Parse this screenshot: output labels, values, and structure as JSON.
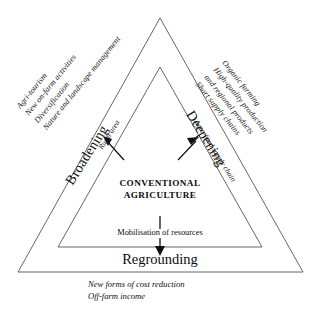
{
  "diagram": {
    "title_core": "CONVENTIONAL\nAGRICULTURE",
    "core_line1": "CONVENTIONAL",
    "core_line2": "AGRICULTURE",
    "stroke_color": "#555555",
    "text_color": "#0d0d0d",
    "background": "#ffffff"
  },
  "axes": {
    "broadening": {
      "label": "Broadening",
      "arrow_label": "Rural area",
      "items": [
        "Agri-tourism",
        "New on-farm activities",
        "Diversification",
        "Nature and landscape management"
      ]
    },
    "deepening": {
      "label": "Deepening",
      "arrow_label": "Agro-food supply chain",
      "items": [
        "Organic farming",
        "High-quality production",
        "and regional products",
        "Short supply chains"
      ]
    },
    "regrounding": {
      "label": "Regrounding",
      "arrow_label": "Mobilisation of resources",
      "items": [
        "New forms of cost reduction",
        "Off-farm income"
      ]
    }
  }
}
